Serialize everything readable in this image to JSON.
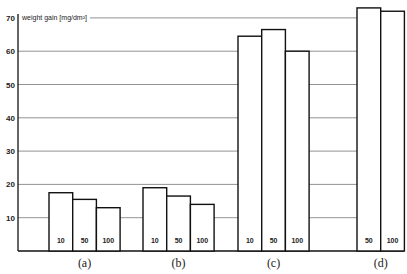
{
  "chart_data": {
    "type": "bar",
    "title": "",
    "ylabel": "weight gain [mg/dm²]",
    "xlabel": "",
    "ylim": [
      0,
      70
    ],
    "yticks": [
      10,
      20,
      30,
      40,
      50,
      60,
      70
    ],
    "grid": true,
    "legend": null,
    "groups": [
      {
        "label": "(a)",
        "bars": [
          {
            "label": "10",
            "value": 17.5
          },
          {
            "label": "50",
            "value": 15.5
          },
          {
            "label": "100",
            "value": 13
          }
        ]
      },
      {
        "label": "(b)",
        "bars": [
          {
            "label": "10",
            "value": 19
          },
          {
            "label": "50",
            "value": 16.5
          },
          {
            "label": "100",
            "value": 14
          }
        ]
      },
      {
        "label": "(c)",
        "bars": [
          {
            "label": "10",
            "value": 64.5
          },
          {
            "label": "50",
            "value": 66.5
          },
          {
            "label": "100",
            "value": 60
          }
        ]
      },
      {
        "label": "(d)",
        "bars": [
          {
            "label": "50",
            "value": 73
          },
          {
            "label": "100",
            "value": 72
          }
        ]
      }
    ]
  }
}
